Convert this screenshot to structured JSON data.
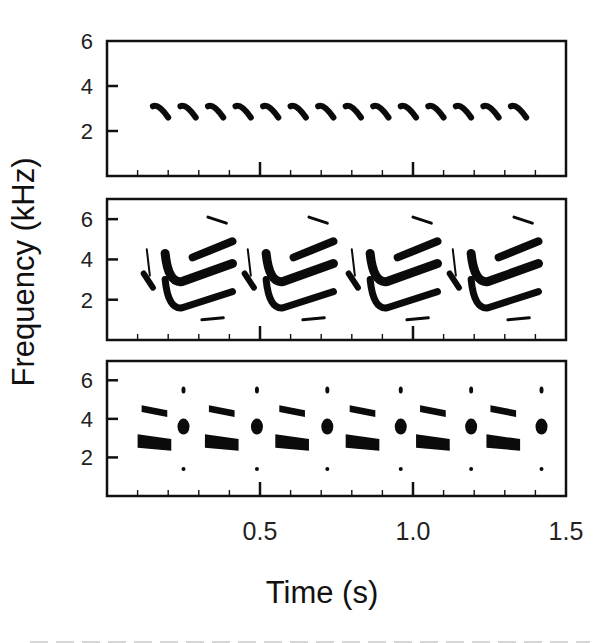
{
  "chart_data": {
    "type": "spectrogram",
    "title": "",
    "xlabel": "Time (s)",
    "ylabel": "Frequency (kHz)",
    "shared_x": true,
    "xlim": [
      0.0,
      1.5
    ],
    "x_tick_labels": [
      "0.5",
      "1.0",
      "1.5"
    ],
    "x_major_ticks": [
      0.5,
      1.0
    ],
    "x_minor_tick_step": 0.1,
    "grid": false,
    "legend": null,
    "panels": [
      {
        "id": "top",
        "ylim": [
          0,
          6
        ],
        "y_tick_labels": [
          "2",
          "4",
          "6"
        ],
        "y_ticks": [
          2,
          4,
          6
        ],
        "description": "Train of 14 identical short downsweep syllables",
        "syllables": {
          "count": 14,
          "start_times_s": [
            0.15,
            0.24,
            0.33,
            0.42,
            0.51,
            0.6,
            0.69,
            0.78,
            0.87,
            0.96,
            1.05,
            1.14,
            1.23,
            1.32
          ],
          "duration_s": 0.05,
          "freq_start_khz": 3.1,
          "freq_end_khz": 2.6
        }
      },
      {
        "id": "middle",
        "ylim": [
          0,
          7
        ],
        "y_tick_labels": [
          "2",
          "4",
          "6"
        ],
        "y_ticks": [
          2,
          4,
          6
        ],
        "description": "Four repeated complex phrases with harmonic stack (bands at ~2, ~3.3, ~4.5 kHz) plus faint elements near 6 kHz and 1 kHz",
        "phrases": {
          "count": 4,
          "start_times_s": [
            0.12,
            0.45,
            0.79,
            1.12
          ],
          "period_s": 0.33,
          "components_khz": [
            {
              "name": "intro-note",
              "t_offset": 0.0,
              "dur": 0.03,
              "f": [
                2.6,
                3.3
              ]
            },
            {
              "name": "intro-sweep",
              "t_offset": 0.01,
              "dur": 0.01,
              "f": [
                3.2,
                4.5
              ]
            },
            {
              "name": "lower-harmonic",
              "t_offset": 0.07,
              "dur": 0.22,
              "f_start": 3.0,
              "f_min": 1.6,
              "f_end": 2.4
            },
            {
              "name": "middle-harmonic",
              "t_offset": 0.07,
              "dur": 0.22,
              "f_start": 4.3,
              "f_min": 2.9,
              "f_end": 3.8
            },
            {
              "name": "upper-harmonic",
              "t_offset": 0.16,
              "dur": 0.13,
              "f_start": 4.1,
              "f_end": 4.9
            },
            {
              "name": "top-fragment",
              "t_offset": 0.21,
              "dur": 0.06,
              "f": [
                5.8,
                6.1
              ]
            },
            {
              "name": "bottom-fragment",
              "t_offset": 0.19,
              "dur": 0.07,
              "f": [
                1.0,
                1.1
              ]
            }
          ]
        }
      },
      {
        "id": "bottom",
        "ylim": [
          0,
          7
        ],
        "y_tick_labels": [
          "2",
          "4",
          "6"
        ],
        "y_ticks": [
          2,
          4,
          6
        ],
        "description": "Six repeated units: broad band (~2.8 kHz) with parallel upper band (~4.5 kHz), followed by a click-like blob (~3.6 kHz) with dots near 5.5 and 1.4 kHz",
        "units": {
          "count": 6,
          "band_start_times_s": [
            0.1,
            0.32,
            0.55,
            0.78,
            1.01,
            1.24
          ],
          "band_duration_s": 0.11,
          "lower_band_khz": [
            2.5,
            3.2
          ],
          "upper_band_khz": [
            4.3,
            4.7
          ],
          "blob_times_s": [
            0.25,
            0.49,
            0.72,
            0.96,
            1.19,
            1.42
          ],
          "blob_center_khz": 3.6,
          "blob_high_dot_khz": 5.5,
          "blob_low_dot_khz": 1.4
        }
      }
    ]
  },
  "labels": {
    "xlabel": "Time (s)",
    "ylabel": "Frequency (kHz)",
    "x_ticks": [
      "0.5",
      "1.0",
      "1.5"
    ],
    "y_ticks": [
      "2",
      "4",
      "6"
    ]
  }
}
